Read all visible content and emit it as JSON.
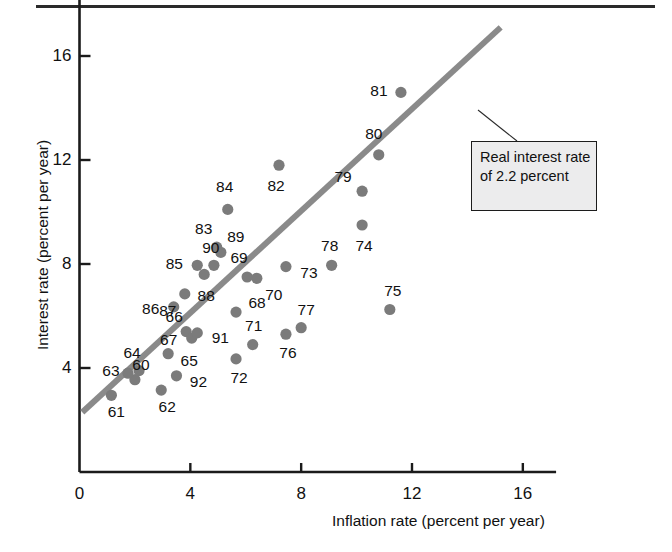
{
  "figure": {
    "top_rule": true,
    "callout": {
      "text": "Real interest rate of 2.2 percent"
    }
  },
  "chart_data": {
    "type": "scatter",
    "title": "",
    "xlabel": "Inflation rate (percent per year)",
    "ylabel": "Interest rate (percent per year)",
    "xlim": [
      0,
      17.2
    ],
    "ylim": [
      0,
      18.2
    ],
    "xticks": [
      0,
      4,
      8,
      12,
      16
    ],
    "xtick_labels": [
      "0",
      "4",
      "8",
      "12",
      "16"
    ],
    "yticks": [
      4,
      8,
      12,
      16
    ],
    "ytick_labels": [
      "4",
      "8",
      "12",
      "16"
    ],
    "grid": false,
    "legend": "none",
    "annotations": [
      {
        "name": "real-interest-rate-callout",
        "text": "Real interest rate of 2.2 percent",
        "points_to": "trend-line"
      }
    ],
    "trend_line": {
      "name": "real interest rate of 2.2 percent",
      "color": "#8a8a8a",
      "intercept": 2.2,
      "slope": 1.0,
      "x_start": 0.1,
      "x_end": 15.2,
      "y_start": 2.3,
      "y_end": 17.1
    },
    "point_label_key": "year",
    "points": [
      {
        "year": "60",
        "x": 2.0,
        "y": 3.55,
        "label_dx": 6,
        "label_dy": -15
      },
      {
        "year": "61",
        "x": 1.15,
        "y": 2.95,
        "label_dx": 5,
        "label_dy": 17
      },
      {
        "year": "62",
        "x": 2.95,
        "y": 3.15,
        "label_dx": 6,
        "label_dy": 17
      },
      {
        "year": "63",
        "x": 1.75,
        "y": 3.8,
        "label_dx": -17,
        "label_dy": -2
      },
      {
        "year": "64",
        "x": 2.15,
        "y": 3.9,
        "label_dx": -7,
        "label_dy": -18
      },
      {
        "year": "65",
        "x": 3.2,
        "y": 4.55,
        "label_dx": 21,
        "label_dy": 7
      },
      {
        "year": "66",
        "x": 3.85,
        "y": 5.4,
        "label_dx": -12,
        "label_dy": -15
      },
      {
        "year": "67",
        "x": 4.05,
        "y": 5.15,
        "label_dx": -23,
        "label_dy": 2
      },
      {
        "year": "68",
        "x": 5.65,
        "y": 6.15,
        "label_dx": 21,
        "label_dy": -9
      },
      {
        "year": "69",
        "x": 6.05,
        "y": 7.5,
        "label_dx": -8,
        "label_dy": -19
      },
      {
        "year": "70",
        "x": 6.4,
        "y": 7.45,
        "label_dx": 17,
        "label_dy": 17
      },
      {
        "year": "71",
        "x": 6.25,
        "y": 4.9,
        "label_dx": 1,
        "label_dy": -19
      },
      {
        "year": "72",
        "x": 5.65,
        "y": 4.35,
        "label_dx": 3,
        "label_dy": 19
      },
      {
        "year": "73",
        "x": 7.45,
        "y": 7.9,
        "label_dx": 23,
        "label_dy": 6
      },
      {
        "year": "74",
        "x": 10.2,
        "y": 9.5,
        "label_dx": 2,
        "label_dy": 21
      },
      {
        "year": "75",
        "x": 11.2,
        "y": 6.25,
        "label_dx": 3,
        "label_dy": -19
      },
      {
        "year": "76",
        "x": 7.45,
        "y": 5.3,
        "label_dx": 2,
        "label_dy": 19
      },
      {
        "year": "77",
        "x": 8.0,
        "y": 5.55,
        "label_dx": 5,
        "label_dy": -18
      },
      {
        "year": "78",
        "x": 9.1,
        "y": 7.95,
        "label_dx": -2,
        "label_dy": -19
      },
      {
        "year": "79",
        "x": 10.2,
        "y": 10.8,
        "label_dx": -19,
        "label_dy": -14
      },
      {
        "year": "80",
        "x": 10.8,
        "y": 12.2,
        "label_dx": -5,
        "label_dy": -21
      },
      {
        "year": "81",
        "x": 11.6,
        "y": 14.6,
        "label_dx": -22,
        "label_dy": -1
      },
      {
        "year": "82",
        "x": 7.2,
        "y": 11.8,
        "label_dx": -3,
        "label_dy": 21
      },
      {
        "year": "83",
        "x": 4.95,
        "y": 8.65,
        "label_dx": -13,
        "label_dy": -18
      },
      {
        "year": "84",
        "x": 5.35,
        "y": 10.1,
        "label_dx": -3,
        "label_dy": -22
      },
      {
        "year": "85",
        "x": 4.25,
        "y": 7.95,
        "label_dx": -23,
        "label_dy": -1
      },
      {
        "year": "86",
        "x": 3.4,
        "y": 6.35,
        "label_dx": -23,
        "label_dy": 2
      },
      {
        "year": "87",
        "x": 3.8,
        "y": 6.85,
        "label_dx": -17,
        "label_dy": 17
      },
      {
        "year": "88",
        "x": 4.5,
        "y": 7.6,
        "label_dx": 2,
        "label_dy": 22
      },
      {
        "year": "89",
        "x": 5.1,
        "y": 8.45,
        "label_dx": 15,
        "label_dy": -15
      },
      {
        "year": "90",
        "x": 4.85,
        "y": 7.95,
        "label_dx": -3,
        "label_dy": -17
      },
      {
        "year": "91",
        "x": 4.25,
        "y": 5.35,
        "label_dx": 23,
        "label_dy": 5
      },
      {
        "year": "92",
        "x": 3.5,
        "y": 3.7,
        "label_dx": 22,
        "label_dy": 6
      }
    ]
  }
}
